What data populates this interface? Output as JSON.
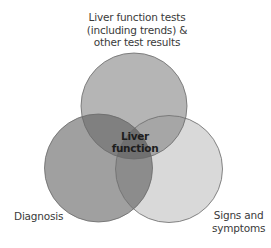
{
  "diagram": {
    "type": "venn",
    "title": "Liver function",
    "center_label": [
      "Liver",
      "function"
    ],
    "sets": [
      {
        "id": "tests",
        "label_lines": [
          "Liver function tests",
          "(including trends) &",
          "other test results"
        ],
        "fill": "#b5b5b5"
      },
      {
        "id": "diagnosis",
        "label_lines": [
          "Diagnosis"
        ],
        "fill": "#a0a0a0"
      },
      {
        "id": "signs",
        "label_lines": [
          "Signs and",
          "symptoms"
        ],
        "fill": "#d9d9d9"
      }
    ],
    "overlap_colors": {
      "tests_diagnosis": "#808080",
      "tests_signs": "#a6a6a6",
      "diagnosis_signs": "#8c8c8c",
      "all": "#707070"
    },
    "stroke": "#6a6a6a"
  }
}
